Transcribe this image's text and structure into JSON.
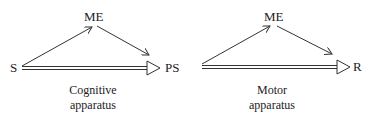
{
  "diagram": {
    "nodes": {
      "s": "S",
      "me_left": "ME",
      "ps": "PS",
      "me_right": "ME",
      "r": "R"
    },
    "captions": {
      "left_line1": "Cognitive",
      "left_line2": "apparatus",
      "right_line1": "Motor",
      "right_line2": "apparatus"
    },
    "edges": [
      {
        "from": "S",
        "to": "ME",
        "style": "single-arrow"
      },
      {
        "from": "ME",
        "to": "PS",
        "style": "single-arrow"
      },
      {
        "from": "S",
        "to": "PS",
        "style": "double-line-open-arrow"
      },
      {
        "from": "PS",
        "to": "ME",
        "style": "single-arrow"
      },
      {
        "from": "ME",
        "to": "R",
        "style": "single-arrow"
      },
      {
        "from": "PS",
        "to": "R",
        "style": "double-line-open-arrow"
      }
    ]
  }
}
